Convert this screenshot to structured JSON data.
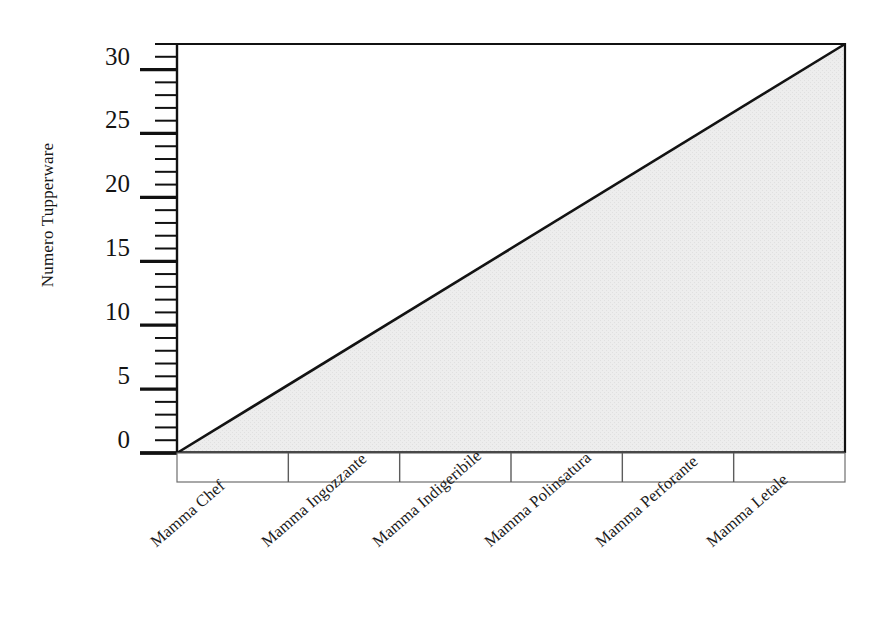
{
  "chart_data": {
    "type": "area",
    "title": "",
    "subtitle": "",
    "xlabel": "",
    "ylabel": "Numero Tupperware",
    "categories": [
      "Mamma Chef",
      "Mamma Ingozzante",
      "Mamma Indigeribile",
      "Mamma Polinsatura",
      "Mamma Perforante",
      "Mamma Letale"
    ],
    "x": [
      0,
      1,
      2,
      3,
      4,
      5
    ],
    "values": [
      0,
      6.4,
      12.8,
      19.2,
      25.6,
      32
    ],
    "series": [
      {
        "name": "Numero Tupperware",
        "values": [
          0,
          6.4,
          12.8,
          19.2,
          25.6,
          32
        ]
      }
    ],
    "ylim": [
      0,
      32
    ],
    "xlim": [
      0,
      5
    ],
    "y_major_ticks": [
      0,
      5,
      10,
      15,
      20,
      25,
      30
    ],
    "y_tick_labels": [
      "0",
      "5",
      "10",
      "15",
      "20",
      "25",
      "30"
    ],
    "y_minor_tick_step": 1,
    "grid": false,
    "legend": "none",
    "fill_color": "#e9e9e9",
    "line_color": "#1a1a1a",
    "axis_color": "#111111",
    "background_color": "#ffffff",
    "x_label_rotation_deg": -41,
    "annotations": []
  },
  "axis": {
    "y_title": "Numero Tupperware",
    "y_labels": [
      {
        "text": "30",
        "value": 30
      },
      {
        "text": "25",
        "value": 25
      },
      {
        "text": "20",
        "value": 20
      },
      {
        "text": "15",
        "value": 15
      },
      {
        "text": "10",
        "value": 10
      },
      {
        "text": "5",
        "value": 5
      },
      {
        "text": "0",
        "value": 0
      }
    ]
  },
  "category_cells": [
    {
      "label": "Mamma Chef"
    },
    {
      "label": "Mamma Ingozzante"
    },
    {
      "label": "Mamma Indigeribile"
    },
    {
      "label": "Mamma Polinsatura"
    },
    {
      "label": "Mamma Perforante"
    },
    {
      "label": "Mamma Letale"
    }
  ]
}
